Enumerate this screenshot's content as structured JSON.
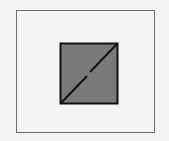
{
  "diagram": {
    "outer_rect": {
      "x": 16,
      "y": 10,
      "w": 139,
      "h": 123,
      "stroke": "#6a6a6a"
    },
    "inner_square": {
      "x": 60,
      "y": 43,
      "w": 58,
      "h": 60,
      "fill": "#7a7a7a",
      "stroke": "#111111"
    },
    "diagonal": {
      "from": "bottom-left",
      "to": "top-right",
      "stroke": "#111111",
      "gap_at_center": true
    }
  }
}
